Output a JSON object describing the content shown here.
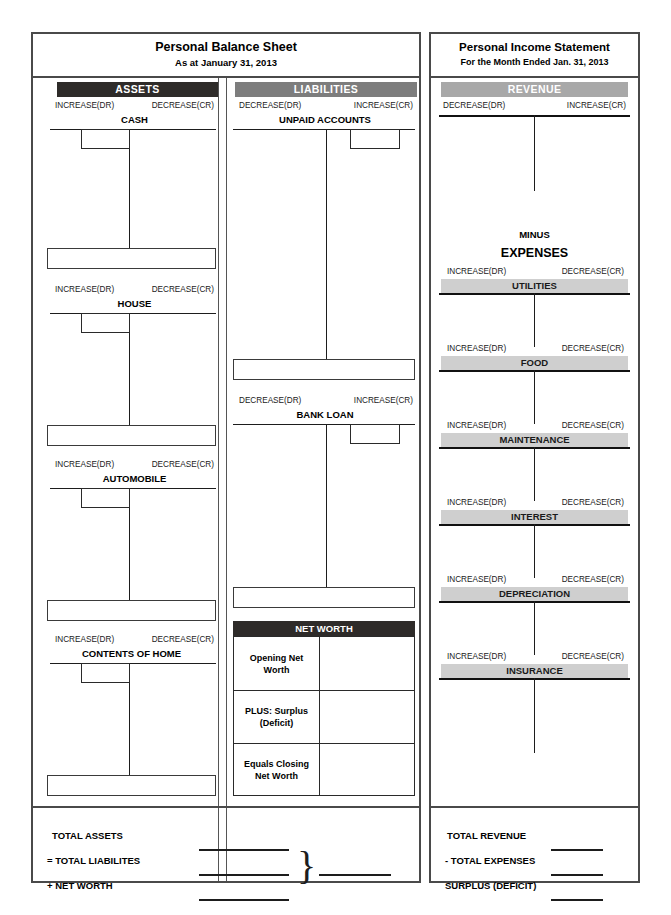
{
  "balance_sheet": {
    "title": "Personal Balance Sheet",
    "subtitle": "As at January 31, 2013",
    "assets": {
      "banner": "ASSETS",
      "banner_color": "#2e2b29",
      "dr_label": "INCREASE(DR)",
      "cr_label": "DECREASE(CR)",
      "accounts": [
        {
          "name": "CASH"
        },
        {
          "name": "HOUSE"
        },
        {
          "name": "AUTOMOBILE"
        },
        {
          "name": "CONTENTS OF HOME"
        }
      ]
    },
    "liabilities": {
      "banner": "LIABILITIES",
      "banner_color": "#7d7d7d",
      "dr_label": "DECREASE(DR)",
      "cr_label": "INCREASE(CR)",
      "accounts": [
        {
          "name": "UNPAID ACCOUNTS"
        },
        {
          "name": "BANK LOAN"
        }
      ]
    },
    "net_worth": {
      "banner": "NET WORTH",
      "banner_color": "#2e2b29",
      "rows": [
        {
          "label": "Opening Net Worth",
          "value": ""
        },
        {
          "label": "PLUS: Surplus (Deficit)",
          "value": ""
        },
        {
          "label": "Equals Closing Net Worth",
          "value": ""
        }
      ]
    },
    "totals": [
      {
        "label": "TOTAL ASSETS",
        "value": ""
      },
      {
        "label": "= TOTAL LIABILITES",
        "value": ""
      },
      {
        "label": "+ NET WORTH",
        "value": ""
      }
    ],
    "totals_brace": "}",
    "totals_result": ""
  },
  "income_statement": {
    "title": "Personal Income Statement",
    "subtitle": "For the Month Ended Jan. 31, 2013",
    "revenue": {
      "banner": "REVENUE",
      "banner_color": "#a8a8a8",
      "dr_label": "DECREASE(DR)",
      "cr_label": "INCREASE(CR)"
    },
    "minus_label": "MINUS",
    "expenses_label": "EXPENSES",
    "expenses": {
      "dr_label": "INCREASE(DR)",
      "cr_label": "DECREASE(CR)",
      "banner_color": "#cfcfcf",
      "accounts": [
        {
          "name": "UTILITIES"
        },
        {
          "name": "FOOD"
        },
        {
          "name": "MAINTENANCE"
        },
        {
          "name": "INTEREST"
        },
        {
          "name": "DEPRECIATION"
        },
        {
          "name": "INSURANCE"
        }
      ]
    },
    "totals": [
      {
        "label": "TOTAL REVENUE",
        "value": ""
      },
      {
        "label": "- TOTAL EXPENSES",
        "value": ""
      },
      {
        "label": "SURPLUS (DEFICIT)",
        "value": ""
      }
    ]
  }
}
